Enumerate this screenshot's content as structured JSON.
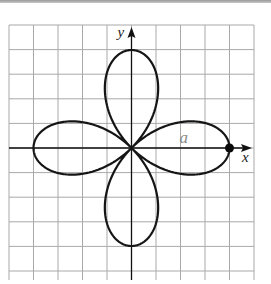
{
  "figure": {
    "x_axis_label": "x",
    "y_axis_label": "y",
    "parameter_label": "a",
    "grid": {
      "cells": 10,
      "x_range": [
        -5,
        5
      ],
      "y_range": [
        -5,
        5
      ]
    },
    "curve": {
      "type": "polar-rose",
      "equation": "r = a cos(2θ)",
      "a": 4,
      "petals": 4
    },
    "marked_point": {
      "x": 4,
      "y": 0
    },
    "colors": {
      "grid": "#a9a9a9",
      "axes": "#111111",
      "curve": "#151515",
      "parameter_label": "#8a8a8a"
    }
  }
}
